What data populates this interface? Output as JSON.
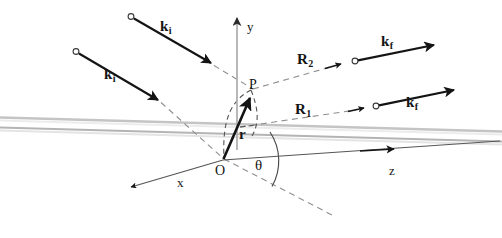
{
  "figure": {
    "background_color": "#ffffff",
    "ink_color": "#141414",
    "slab_color": "#b9b9b9",
    "axis_color": "#a8a8a8",
    "dashed_color": "#8c8c8c"
  },
  "axes": [
    {
      "id": "y-axis",
      "label": "y",
      "label_italic": false,
      "direction": "up",
      "from": [
        237,
        148
      ],
      "to": [
        237,
        14
      ]
    },
    {
      "id": "z-axis",
      "label": "z",
      "label_italic": false,
      "direction": "right",
      "from": [
        223,
        160
      ],
      "to": [
        500,
        142
      ]
    },
    {
      "id": "x-axis",
      "label": "x",
      "label_italic": false,
      "direction": "down-left",
      "from": [
        223,
        160
      ],
      "to": [
        127,
        188
      ]
    }
  ],
  "points": [
    {
      "id": "origin",
      "label": "O",
      "x": 223,
      "y": 160
    },
    {
      "id": "scatter-point",
      "label": "P",
      "x": 252,
      "y": 88
    }
  ],
  "vectors": [
    {
      "id": "r-vector",
      "label": "r",
      "subscript": "",
      "bold": true,
      "from": [
        223,
        160
      ],
      "to": [
        250,
        95
      ]
    },
    {
      "id": "ki-upper",
      "label": "k",
      "subscript": "i",
      "bold": true,
      "from": [
        131,
        16
      ],
      "to": [
        215,
        66
      ]
    },
    {
      "id": "ki-lower",
      "label": "k",
      "subscript": "i",
      "bold": true,
      "from": [
        76,
        51
      ],
      "to": [
        162,
        103
      ]
    },
    {
      "id": "kf-upper",
      "label": "k",
      "subscript": "f",
      "bold": true,
      "from": [
        356,
        60
      ],
      "to": [
        438,
        44
      ]
    },
    {
      "id": "kf-lower",
      "label": "k",
      "subscript": "f",
      "bold": true,
      "from": [
        377,
        105
      ],
      "to": [
        458,
        88
      ]
    }
  ],
  "distance_labels": [
    {
      "id": "R2-label",
      "label": "R",
      "subscript": "2",
      "x": 303,
      "y": 58
    },
    {
      "id": "R1-label",
      "label": "R",
      "subscript": "1",
      "x": 301,
      "y": 108
    }
  ],
  "angle": {
    "id": "theta-angle",
    "label": "θ",
    "symbol_name": "theta",
    "vertex": [
      223,
      160
    ],
    "label_x": 262,
    "label_y": 167
  },
  "labels": {
    "y_axis": "y",
    "z_axis": "z",
    "x_axis": "x",
    "origin": "O",
    "point_p": "P",
    "k_incident": "k",
    "k_incident_sub": "i",
    "k_final": "k",
    "k_final_sub": "f",
    "r_vector": "r",
    "R_first": "R",
    "R_first_sub": "1",
    "R_second": "R",
    "R_second_sub": "2",
    "theta": "θ"
  },
  "slab": {
    "id": "film-slab",
    "description": "thin film / sample surface drawn as two near-horizontal gray lines",
    "top_line": {
      "from": [
        0,
        118
      ],
      "to": [
        502,
        132
      ]
    },
    "bottom_line": {
      "from": [
        0,
        128
      ],
      "to": [
        502,
        142
      ]
    }
  }
}
